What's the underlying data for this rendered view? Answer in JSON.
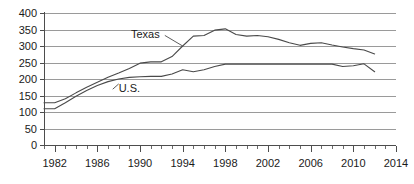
{
  "chart_data": {
    "type": "line",
    "title": "",
    "subtitle": "",
    "xlabel": "",
    "ylabel": "",
    "xlim": [
      1981,
      2014
    ],
    "ylim": [
      0,
      400
    ],
    "grid": true,
    "legend_position": "inline-annotation",
    "y_ticks": [
      0,
      50,
      100,
      150,
      200,
      250,
      300,
      350,
      400
    ],
    "y_tick_labels": [
      "0",
      "50",
      "100",
      "150",
      "200",
      "250",
      "300",
      "350",
      "400"
    ],
    "x_ticks": [
      1982,
      1986,
      1990,
      1994,
      1998,
      2002,
      2006,
      2010,
      2014
    ],
    "x_tick_labels": [
      "1982",
      "1986",
      "1990",
      "1994",
      "1998",
      "2002",
      "2006",
      "2010",
      "2014"
    ],
    "x_minor_tick_interval": 1,
    "annotations": [
      {
        "text": "Texas",
        "x": 1990.5,
        "y": 323,
        "leader_to_x": 1994.0,
        "leader_to_y": 300
      },
      {
        "text": "U.S.",
        "x": 1989.0,
        "y": 160,
        "leader_to_x": 1988.0,
        "leader_to_y": 185
      }
    ],
    "series": [
      {
        "name": "Texas",
        "color": "#4a4a4a",
        "x": [
          1981,
          1982,
          1983,
          1984,
          1985,
          1986,
          1987,
          1988,
          1989,
          1990,
          1991,
          1992,
          1993,
          1994,
          1995,
          1996,
          1997,
          1998,
          1999,
          2000,
          2001,
          2002,
          2003,
          2004,
          2005,
          2006,
          2007,
          2008,
          2009,
          2010,
          2011,
          2012
        ],
        "values": [
          128,
          128,
          140,
          158,
          175,
          190,
          205,
          218,
          232,
          248,
          252,
          252,
          268,
          300,
          330,
          332,
          348,
          352,
          335,
          330,
          332,
          328,
          320,
          310,
          302,
          308,
          310,
          303,
          297,
          292,
          288,
          276
        ]
      },
      {
        "name": "U.S.",
        "color": "#4a4a4a",
        "x": [
          1981,
          1982,
          1983,
          1984,
          1985,
          1986,
          1987,
          1988,
          1989,
          1990,
          1991,
          1992,
          1993,
          1994,
          1995,
          1996,
          1997,
          1998,
          1999,
          2000,
          2001,
          2002,
          2003,
          2004,
          2005,
          2006,
          2007,
          2008,
          2009,
          2010,
          2011,
          2012
        ],
        "values": [
          110,
          110,
          128,
          148,
          165,
          180,
          192,
          200,
          205,
          207,
          208,
          208,
          215,
          228,
          222,
          228,
          238,
          245,
          245,
          245,
          245,
          245,
          245,
          245,
          245,
          245,
          245,
          245,
          238,
          240,
          246,
          222
        ]
      }
    ]
  }
}
